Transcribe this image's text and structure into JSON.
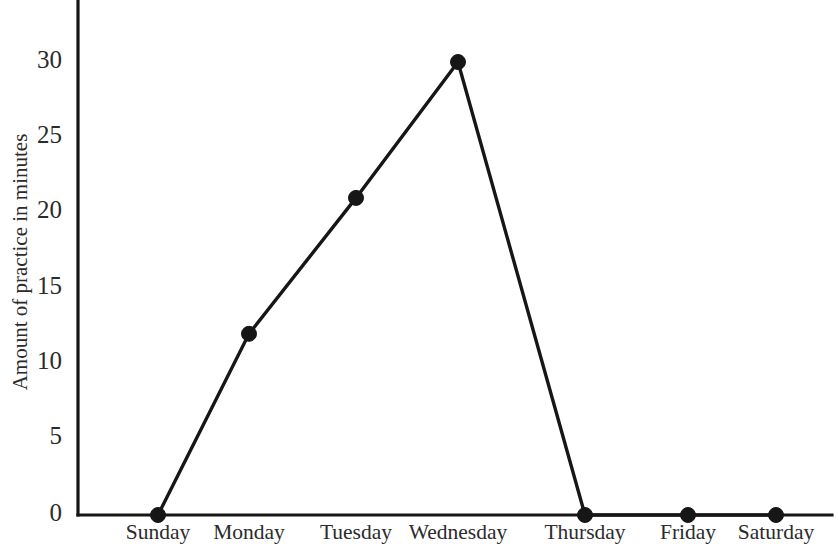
{
  "chart_data": {
    "type": "line",
    "title": "",
    "subtitle": "",
    "xlabel": "",
    "ylabel": "Amount of practice in minutes",
    "categories": [
      "Sunday",
      "Monday",
      "Tuesday",
      "Wednesday",
      "Thursday",
      "Friday",
      "Saturday"
    ],
    "values": [
      0,
      12,
      21,
      30,
      0,
      0,
      0
    ],
    "series": [
      {
        "name": "Amount of practice in minutes",
        "values": [
          0,
          12,
          21,
          30,
          0,
          0,
          0
        ]
      }
    ],
    "ylim": [
      0,
      33
    ],
    "ytick_labels": [
      "0",
      "5",
      "10",
      "15",
      "20",
      "25",
      "30"
    ],
    "ytick_values": [
      0,
      5,
      10,
      15,
      20,
      25,
      30
    ],
    "grid": false,
    "legend": false,
    "legend_position": "none",
    "marker": "filled-circle",
    "line_color": "#161616",
    "marker_color": "#161616",
    "axis_color": "#161616",
    "background_color": "#ffffff",
    "annotations": []
  },
  "geometry": {
    "plot_left": 78,
    "plot_right": 832,
    "plot_top": 0,
    "baseline_y": 515,
    "unit_px": 15.1,
    "point_x": [
      158,
      249,
      356,
      458,
      585,
      688,
      776
    ],
    "ytick_y": [
      515,
      438,
      363,
      288,
      212,
      137,
      62
    ],
    "marker_radius": 7.5,
    "xlabel_y": 524,
    "ylabel_x": 22,
    "ylabel_y": 262
  }
}
